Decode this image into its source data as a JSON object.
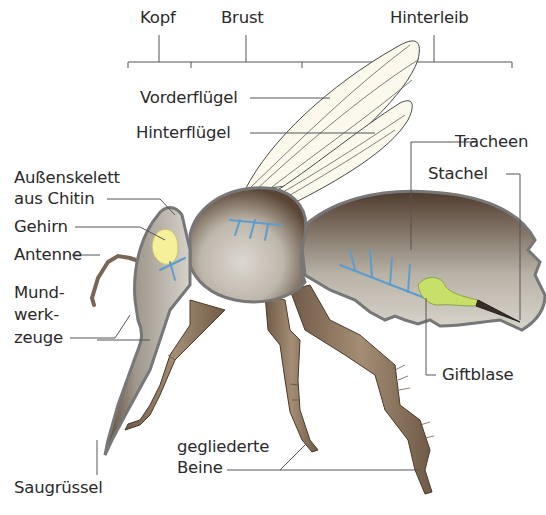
{
  "segments": {
    "head": "Kopf",
    "thorax": "Brust",
    "abdomen": "Hinterleib"
  },
  "labels": {
    "forewing": "Vorderflügel",
    "hindwing": "Hinterflügel",
    "exoskeleton_line1": "Außenskelett",
    "exoskeleton_line2": "aus Chitin",
    "brain": "Gehirn",
    "antenna": "Antenne",
    "mouthparts_line1": "Mund-",
    "mouthparts_line2": "werk-",
    "mouthparts_line3": "zeuge",
    "proboscis": "Saugrüssel",
    "trachea": "Tracheen",
    "sting": "Stachel",
    "venom_sac": "Giftblase",
    "legs_line1": "gegliederte",
    "legs_line2": "Beine"
  },
  "colors": {
    "body_light": "#d9d6ce",
    "body_dark": "#5e4a3a",
    "outline": "#6b6b6b",
    "wing": "#fbf8ec",
    "brain": "#f6f09a",
    "trachea": "#6aa8d8",
    "venom_sac": "#c8e06a",
    "leg": "#8c7560",
    "leader_line": "#555555"
  }
}
